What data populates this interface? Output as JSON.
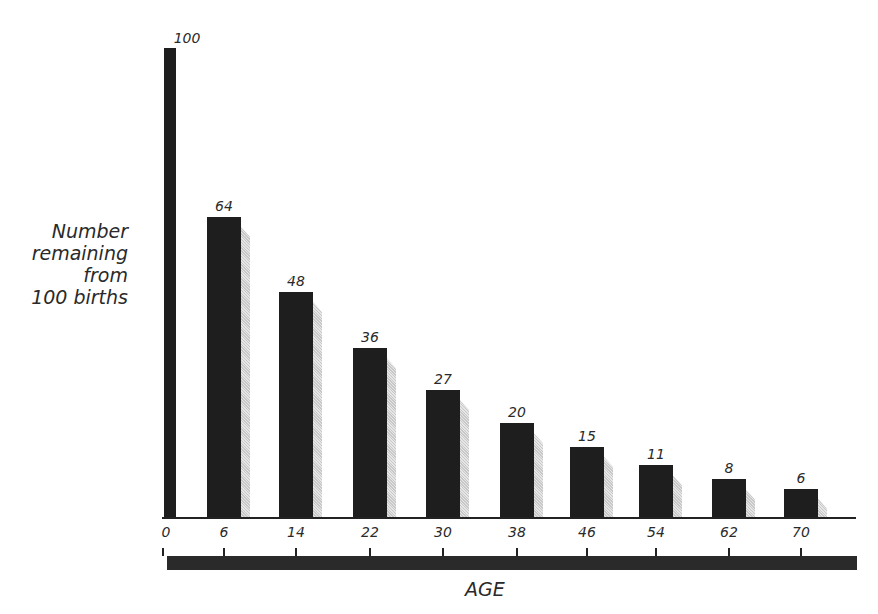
{
  "chart_data": {
    "type": "bar",
    "title": "",
    "xlabel": "AGE",
    "ylabel": "Number remaining from 100 births",
    "ylabel_lines": [
      "Number",
      "remaining",
      "from",
      "100 births"
    ],
    "categories": [
      "0",
      "6",
      "14",
      "22",
      "30",
      "38",
      "46",
      "54",
      "62",
      "70"
    ],
    "values": [
      100,
      64,
      48,
      36,
      27,
      20,
      15,
      11,
      8,
      6
    ],
    "value_labels": [
      "100",
      "64",
      "48",
      "36",
      "27",
      "20",
      "15",
      "11",
      "8",
      "6"
    ],
    "ylim": [
      0,
      100
    ],
    "grid": false,
    "legend": null
  },
  "colors": {
    "bar": "#1e1e1e",
    "shadow": "#d0d0d0",
    "text": "#2a2a2a",
    "background": "#ffffff"
  }
}
